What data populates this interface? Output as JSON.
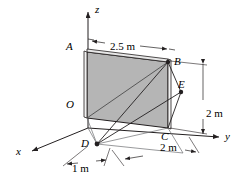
{
  "figure": {
    "background_color": "#ffffff",
    "plate_fill_color": "#b5b5b5",
    "line_color": "#231f20",
    "edge_highlight_color": "#ffffff"
  },
  "axes": [
    {
      "id": "x",
      "label": "x",
      "x": 16,
      "y": 146,
      "direction": "down-left"
    },
    {
      "id": "y",
      "label": "y",
      "x": 225,
      "y": 131,
      "direction": "right"
    },
    {
      "id": "z",
      "label": "z",
      "x": 95,
      "y": 4,
      "direction": "up"
    }
  ],
  "points": [
    {
      "id": "A",
      "label": "A",
      "x": 66,
      "y": 41,
      "dot": false
    },
    {
      "id": "B",
      "label": "B",
      "x": 174,
      "y": 56,
      "dot": true
    },
    {
      "id": "C",
      "label": "C",
      "x": 161,
      "y": 131,
      "dot": false
    },
    {
      "id": "D",
      "label": "D",
      "x": 81,
      "y": 138,
      "dot": true
    },
    {
      "id": "E",
      "label": "E",
      "x": 178,
      "y": 79,
      "dot": true
    },
    {
      "id": "O",
      "label": "O",
      "x": 66,
      "y": 99,
      "dot": false
    }
  ],
  "dimensions": [
    {
      "id": "plate-width",
      "label": "2.5 m",
      "value": 2.5,
      "unit": "m",
      "x": 110,
      "y": 41,
      "orientation": "top-edge"
    },
    {
      "id": "plate-height",
      "label": "2 m",
      "value": 2,
      "unit": "m",
      "x": 206,
      "y": 108,
      "orientation": "vertical-right"
    },
    {
      "id": "base-depth",
      "label": "2 m",
      "value": 2,
      "unit": "m",
      "x": 160,
      "y": 142,
      "orientation": "ground-right"
    },
    {
      "id": "base-offset",
      "label": "1 m",
      "value": 1,
      "unit": "m",
      "x": 72,
      "y": 163,
      "orientation": "ground-left"
    }
  ]
}
